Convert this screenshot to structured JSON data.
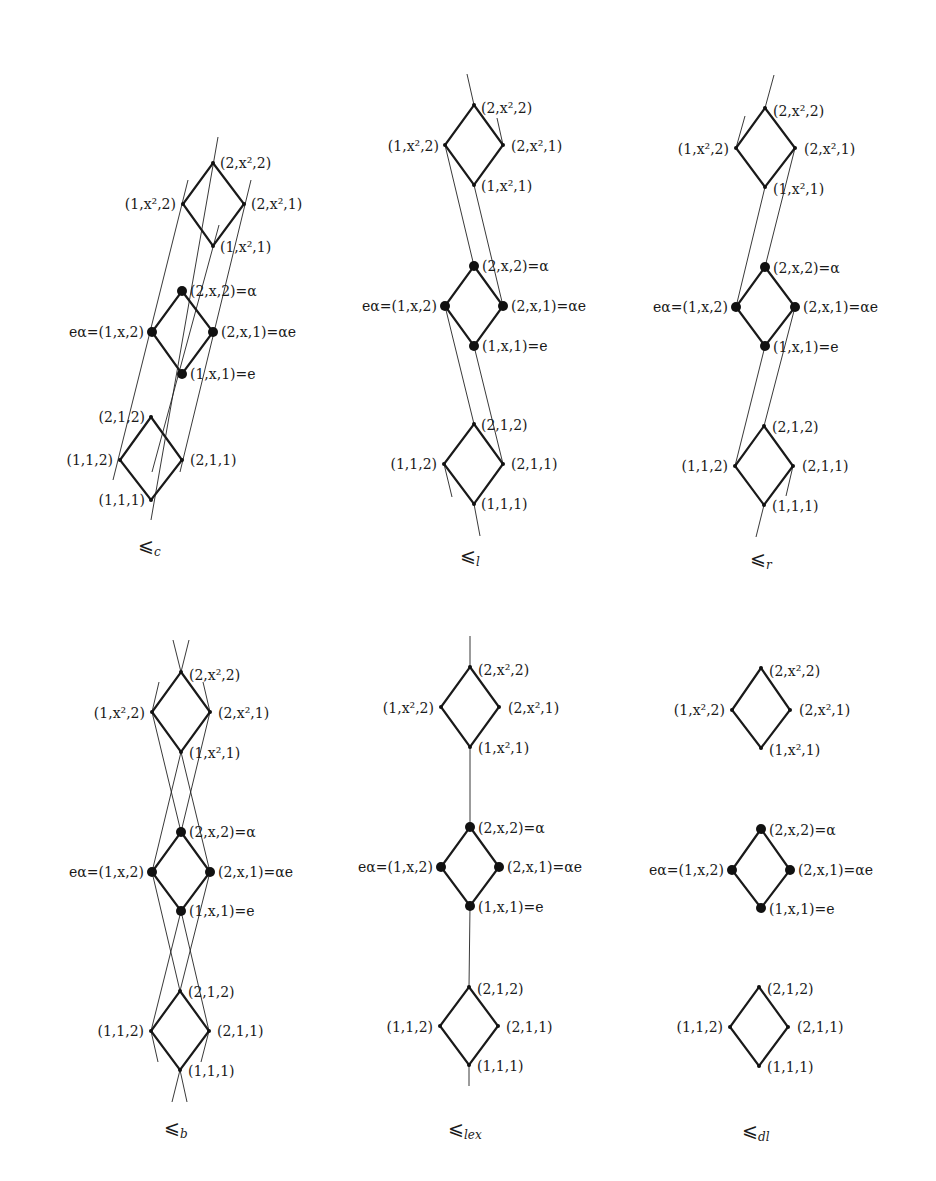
{
  "figure": {
    "diagrams": [
      {
        "id": "c",
        "caption": "⩽",
        "caption_sub": "c",
        "nodes": {
          "d2_top": "(2,x²,2)",
          "d2_left": "(1,x²,2)",
          "d2_right": "(2,x²,1)",
          "d2_bottom": "(1,x²,1)",
          "d1_top": "(2,x,2)=α",
          "d1_left": "eα=(1,x,2)",
          "d1_right": "(2,x,1)=αe",
          "d1_bottom": "(1,x,1)=e",
          "d0_top": "(2,1,2)",
          "d0_left": "(1,1,2)",
          "d0_right": "(2,1,1)",
          "d0_bottom": "(1,1,1)"
        }
      },
      {
        "id": "l",
        "caption": "⩽",
        "caption_sub": "l",
        "nodes": {
          "d2_top": "(2,x²,2)",
          "d2_left": "(1,x²,2)",
          "d2_right": "(2,x²,1)",
          "d2_bottom": "(1,x²,1)",
          "d1_top": "(2,x,2)=α",
          "d1_left": "eα=(1,x,2)",
          "d1_right": "(2,x,1)=αe",
          "d1_bottom": "(1,x,1)=e",
          "d0_top": "(2,1,2)",
          "d0_left": "(1,1,2)",
          "d0_right": "(2,1,1)",
          "d0_bottom": "(1,1,1)"
        }
      },
      {
        "id": "r",
        "caption": "⩽",
        "caption_sub": "r",
        "nodes": {
          "d2_top": "(2,x²,2)",
          "d2_left": "(1,x²,2)",
          "d2_right": "(2,x²,1)",
          "d2_bottom": "(1,x²,1)",
          "d1_top": "(2,x,2)=α",
          "d1_left": "eα=(1,x,2)",
          "d1_right": "(2,x,1)=αe",
          "d1_bottom": "(1,x,1)=e",
          "d0_top": "(2,1,2)",
          "d0_left": "(1,1,2)",
          "d0_right": "(2,1,1)",
          "d0_bottom": "(1,1,1)"
        }
      },
      {
        "id": "b",
        "caption": "⩽",
        "caption_sub": "b",
        "nodes": {
          "d2_top": "(2,x²,2)",
          "d2_left": "(1,x²,2)",
          "d2_right": "(2,x²,1)",
          "d2_bottom": "(1,x²,1)",
          "d1_top": "(2,x,2)=α",
          "d1_left": "eα=(1,x,2)",
          "d1_right": "(2,x,1)=αe",
          "d1_bottom": "(1,x,1)=e",
          "d0_top": "(2,1,2)",
          "d0_left": "(1,1,2)",
          "d0_right": "(2,1,1)",
          "d0_bottom": "(1,1,1)"
        }
      },
      {
        "id": "lex",
        "caption": "⩽",
        "caption_sub": "lex",
        "nodes": {
          "d2_top": "(2,x²,2)",
          "d2_left": "(1,x²,2)",
          "d2_right": "(2,x²,1)",
          "d2_bottom": "(1,x²,1)",
          "d1_top": "(2,x,2)=α",
          "d1_left": "eα=(1,x,2)",
          "d1_right": "(2,x,1)=αe",
          "d1_bottom": "(1,x,1)=e",
          "d0_top": "(2,1,2)",
          "d0_left": "(1,1,2)",
          "d0_right": "(2,1,1)",
          "d0_bottom": "(1,1,1)"
        }
      },
      {
        "id": "dl",
        "caption": "⩽",
        "caption_sub": "dl",
        "nodes": {
          "d2_top": "(2,x²,2)",
          "d2_left": "(1,x²,2)",
          "d2_right": "(2,x²,1)",
          "d2_bottom": "(1,x²,1)",
          "d1_top": "(2,x,2)=α",
          "d1_left": "eα=(1,x,2)",
          "d1_right": "(2,x,1)=αe",
          "d1_bottom": "(1,x,1)=e",
          "d0_top": "(2,1,2)",
          "d0_left": "(1,1,2)",
          "d0_right": "(2,1,1)",
          "d0_bottom": "(1,1,1)"
        }
      }
    ]
  }
}
